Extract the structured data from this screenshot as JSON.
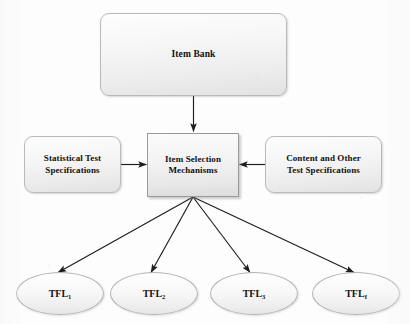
{
  "diagram": {
    "background_color": "#fdfdfd",
    "line_color": "#1d1d1d",
    "node_fill_top": "#fdfdfd",
    "node_fill_bottom": "#e2e2e2",
    "node_border": "#b9b9b9",
    "nodes": {
      "item_bank": "Item Bank",
      "statistical_specs": "Statistical Test\nSpecifications",
      "item_selection": "Item Selection\nMechanisms",
      "content_specs": "Content and Other\nTest Specifications",
      "tfl": [
        {
          "base": "TFL",
          "sub": "1"
        },
        {
          "base": "TFL",
          "sub": "2"
        },
        {
          "base": "TFL",
          "sub": "3"
        },
        {
          "base": "TFL",
          "sub": "f"
        }
      ]
    },
    "edges": [
      {
        "from": "item_bank",
        "to": "item_selection",
        "kind": "arrow-down"
      },
      {
        "from": "statistical_specs",
        "to": "item_selection",
        "kind": "arrow-right"
      },
      {
        "from": "content_specs",
        "to": "item_selection",
        "kind": "arrow-left"
      },
      {
        "from": "item_selection",
        "to": "tfl_1",
        "kind": "arrow-diagonal"
      },
      {
        "from": "item_selection",
        "to": "tfl_2",
        "kind": "arrow-diagonal"
      },
      {
        "from": "item_selection",
        "to": "tfl_3",
        "kind": "arrow-diagonal"
      },
      {
        "from": "item_selection",
        "to": "tfl_4",
        "kind": "arrow-diagonal"
      }
    ],
    "continuation_marker": "·"
  }
}
